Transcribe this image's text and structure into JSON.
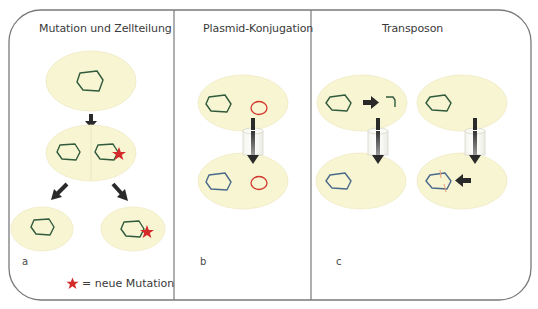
{
  "colors": {
    "cell_fill": "#f8f5d2",
    "cell_stroke": "#ece8c0",
    "chromosome": "#2f5a3c",
    "chromosome_blue": "#4a6a8a",
    "plasmid": "#d23a2f",
    "star": "#d42a2a",
    "arrow": "#2a2a2a",
    "frame": "#7a7a7a",
    "transposon_mark": "#e8a07a"
  },
  "panels": [
    {
      "id": "a",
      "title": "Mutation und Zellteilung",
      "label": "a"
    },
    {
      "id": "b",
      "title": "Plasmid-Konjugation",
      "label": "b"
    },
    {
      "id": "c",
      "title": "Transposon",
      "label": "c"
    }
  ],
  "legend": {
    "symbol": "star-icon",
    "text": "= neue Mutation"
  }
}
